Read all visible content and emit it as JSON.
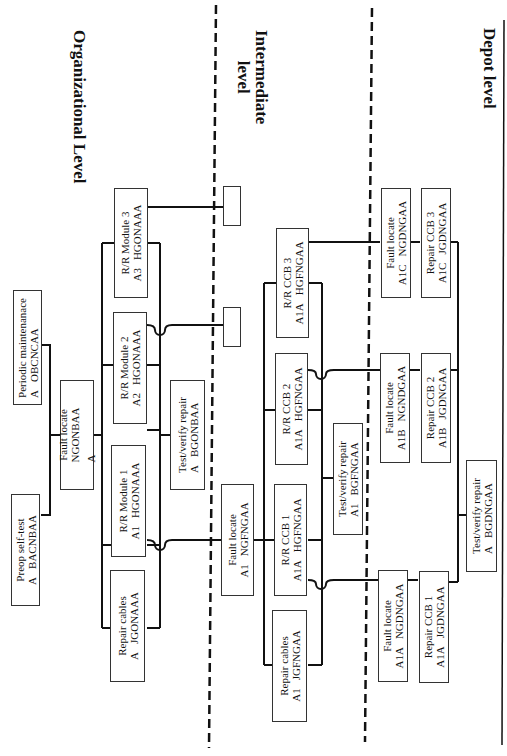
{
  "levels": {
    "organizational": {
      "title": "Organizational Level"
    },
    "intermediate": {
      "title_line1": "Intermediate",
      "title_line2": "level"
    },
    "depot": {
      "title": "Depot level"
    }
  },
  "organizational": {
    "periodic_maintenance": {
      "line1": "Periodic maintenanace",
      "prefix": "A",
      "code": "OBCNCAA"
    },
    "preop_self_test": {
      "line1": "Preop self-test",
      "prefix": "A",
      "code": "BACNBAA"
    },
    "fault_locate": {
      "line1": "Fault locate",
      "line2": "NGONBAA",
      "prefix": "A"
    },
    "rr_module_3": {
      "line1": "R/R Module 3",
      "prefix": "A3",
      "code": "HGONAAA"
    },
    "rr_module_2": {
      "line1": "R/R Module 2",
      "prefix": "A2",
      "code": "HGONAAA"
    },
    "rr_module_1": {
      "line1": "R/R Module 1",
      "prefix": "A1",
      "code": "HGONAAA"
    },
    "repair_cables": {
      "line1": "Repair cables",
      "prefix": "A",
      "code": "JGONAAA"
    },
    "test_verify_repair": {
      "line1": "Test/verify repair",
      "prefix": "A",
      "code": "BGONBAA"
    }
  },
  "intermediate": {
    "fault_locate": {
      "line1": "Fault locate",
      "prefix": "A1",
      "code": "NGFNGAA"
    },
    "rr_ccb_3": {
      "line1": "R/R  CCB 3",
      "prefix": "A1A",
      "code": "HGFNGAA"
    },
    "rr_ccb_2": {
      "line1": "R/R  CCB 2",
      "prefix": "A1A",
      "code": "HGFNGAA"
    },
    "rr_ccb_1": {
      "line1": "R/R  CCB 1",
      "prefix": "A1A",
      "code": "HGFNGAA"
    },
    "repair_cables": {
      "line1": "Repair cables",
      "prefix": "A1",
      "code": "JGFNGAA"
    },
    "test_verify_repair": {
      "line1": "Test/verify repair",
      "prefix": "A1",
      "code": "BGFNGAA"
    }
  },
  "depot": {
    "fault_locate_c": {
      "line1": "Fault locate",
      "prefix": "A1C",
      "code": "NGDNGAA"
    },
    "repair_ccb_3": {
      "line1": "Repair  CCB 3",
      "prefix": "A1C",
      "code": "JGDNGAA"
    },
    "fault_locate_b": {
      "line1": "Fault locate",
      "prefix": "A1B",
      "code": "NGNDGAA"
    },
    "repair_ccb_2": {
      "line1": "Repair  CCB 2",
      "prefix": "A1B",
      "code": "JGDNGAA"
    },
    "fault_locate_a": {
      "line1": "Fault locate",
      "prefix": "A1A",
      "code": "NGDNGAA"
    },
    "repair_ccb_1": {
      "line1": "Repair  CCB 1",
      "prefix": "A1A",
      "code": "JGDNGAA"
    },
    "test_verify_repair": {
      "line1": "Test/verify repair",
      "prefix": "A",
      "code": "BGDNGAA"
    }
  }
}
